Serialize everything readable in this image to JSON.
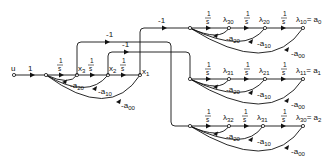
{
  "diagram": {
    "type": "signal-flow-graph",
    "input": {
      "label": "u",
      "gain": "1"
    },
    "main_chain": {
      "integrator_gain_num": "1",
      "integrator_gain_den": "s",
      "states": [
        "x3",
        "x2",
        "x1"
      ],
      "feedback": [
        "-a20",
        "-a10",
        "-a00"
      ]
    },
    "cross_links": [
      {
        "from": "x1",
        "to": "chain_0",
        "gain": "-1"
      },
      {
        "from": "x3",
        "to": "chain_2",
        "gain": "-1"
      },
      {
        "from": "x2",
        "to": "chain_1",
        "gain": "-1"
      }
    ],
    "chains": [
      {
        "nodes": [
          "λ30",
          "λ20",
          "λ10 = a0"
        ],
        "feedback": [
          "-a20",
          "-a10",
          "-a00"
        ]
      },
      {
        "nodes": [
          "λ31",
          "λ21",
          "λ11 = a1"
        ],
        "feedback": [
          "-a20",
          "-a10",
          "-a00"
        ]
      },
      {
        "nodes": [
          "λ32",
          "λ31",
          "λ30 = a2"
        ],
        "feedback": [
          "-a20",
          "-a10",
          "-a00"
        ]
      }
    ]
  },
  "labels": {
    "u": "u",
    "one": "1",
    "num": "1",
    "den": "s",
    "minus_one": "-1",
    "x3": "x",
    "x3_sub": "3",
    "x2": "x",
    "x2_sub": "2",
    "x1": "x",
    "x1_sub": "1",
    "fb_a20": "-a",
    "fb_a20_sub": "20",
    "fb_a10": "-a",
    "fb_a10_sub": "10",
    "fb_a00": "-a",
    "fb_a00_sub": "00",
    "lam": "λ",
    "c0_n1_sub": "30",
    "c0_n2_sub": "20",
    "c0_end_sub": "10",
    "c0_end_rhs": "= a",
    "c0_end_rhs_sub": "0",
    "c1_n1_sub": "31",
    "c1_n2_sub": "21",
    "c1_end_sub": "11",
    "c1_end_rhs": "= a",
    "c1_end_rhs_sub": "1",
    "c2_n1_sub": "32",
    "c2_n2_sub": "31",
    "c2_end_sub": "30",
    "c2_end_rhs": "= a",
    "c2_end_rhs_sub": "2"
  }
}
